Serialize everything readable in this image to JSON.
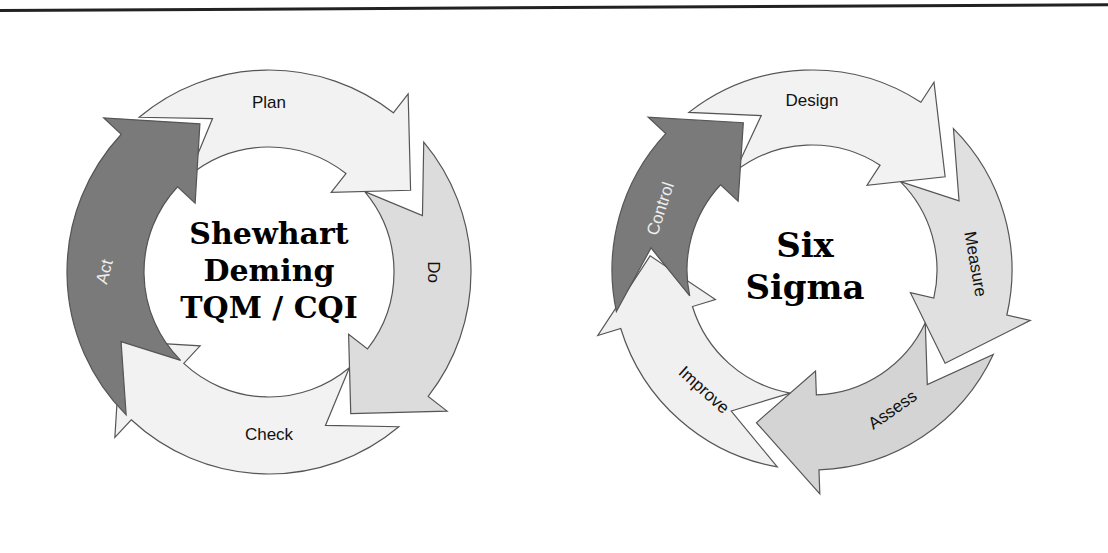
{
  "diagrams": [
    {
      "name": "pdca-cycle",
      "center_title_lines": [
        "Shewhart",
        "Deming",
        "TQM / CQI"
      ],
      "segments": [
        {
          "label": "Plan",
          "fill": "#f2f2f2",
          "text_color": "#111111"
        },
        {
          "label": "Do",
          "fill": "#dcdcdc",
          "text_color": "#111111"
        },
        {
          "label": "Check",
          "fill": "#f2f2f2",
          "text_color": "#111111"
        },
        {
          "label": "Act",
          "fill": "#7a7a7a",
          "text_color": "#eeeeee"
        }
      ]
    },
    {
      "name": "six-sigma-cycle",
      "center_title_lines": [
        "Six",
        "Sigma"
      ],
      "segments": [
        {
          "label": "Design",
          "fill": "#f2f2f2",
          "text_color": "#111111"
        },
        {
          "label": "Measure",
          "fill": "#e0e0e0",
          "text_color": "#111111"
        },
        {
          "label": "Assess",
          "fill": "#d4d4d4",
          "text_color": "#111111"
        },
        {
          "label": "Improve",
          "fill": "#f0f0f0",
          "text_color": "#111111"
        },
        {
          "label": "Control",
          "fill": "#7a7a7a",
          "text_color": "#eeeeee"
        }
      ]
    }
  ]
}
